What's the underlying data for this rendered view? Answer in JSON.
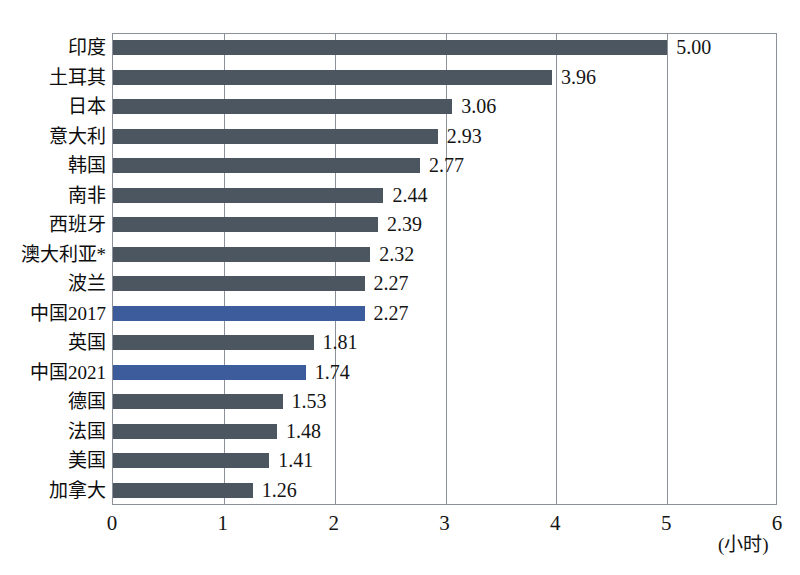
{
  "chart_data": {
    "type": "bar",
    "orientation": "horizontal",
    "title": "",
    "subtitle": "",
    "xlabel": "(小时)",
    "ylabel": "",
    "xlim": [
      0,
      6
    ],
    "xticks": [
      "0",
      "1",
      "2",
      "3",
      "4",
      "5",
      "6"
    ],
    "grid": true,
    "legend": "none",
    "categories": [
      "印度",
      "土耳其",
      "日本",
      "意大利",
      "韩国",
      "南非",
      "西班牙",
      "澳大利亚*",
      "波兰",
      "中国2017",
      "英国",
      "中国2021",
      "德国",
      "法国",
      "美国",
      "加拿大"
    ],
    "values": [
      5.0,
      3.96,
      3.06,
      2.93,
      2.77,
      2.44,
      2.39,
      2.32,
      2.27,
      2.27,
      1.81,
      1.74,
      1.53,
      1.48,
      1.41,
      1.26
    ],
    "value_labels": [
      "5.00",
      "3.96",
      "3.06",
      "2.93",
      "2.77",
      "2.44",
      "2.39",
      "2.32",
      "2.27",
      "2.27",
      "1.81",
      "1.74",
      "1.53",
      "1.48",
      "1.41",
      "1.26"
    ],
    "highlighted": [
      false,
      false,
      false,
      false,
      false,
      false,
      false,
      false,
      false,
      true,
      false,
      true,
      false,
      false,
      false,
      false
    ],
    "colors": {
      "bar_default": "#4b5661",
      "bar_highlight": "#3c5c9c",
      "axis": "#8b9099",
      "text": "#141414",
      "background": "#ffffff"
    }
  }
}
